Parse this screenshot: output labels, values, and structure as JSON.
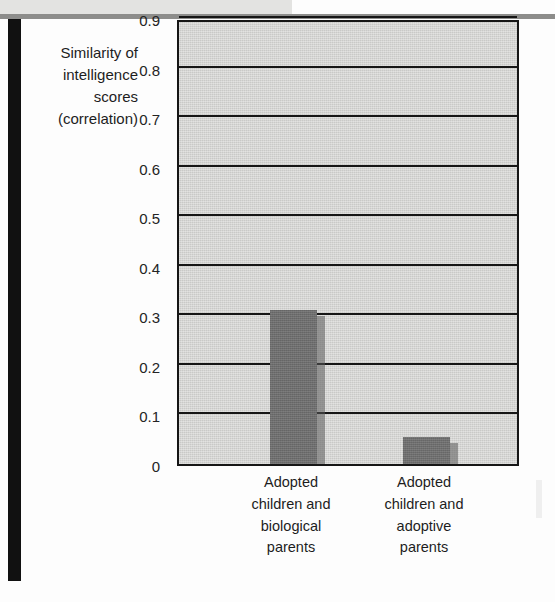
{
  "chart_data": {
    "type": "bar",
    "title": "",
    "subtitle": "",
    "xlabel": "",
    "ylabel": "Similarity of intelligence scores (correlation)",
    "ylabel_lines": [
      "Similarity of",
      "intelligence",
      "scores",
      "(correlation)"
    ],
    "categories": [
      "Adopted children and biological parents",
      "Adopted children and adoptive parents"
    ],
    "category_lines": [
      [
        "Adopted",
        "children and",
        "biological",
        "parents"
      ],
      [
        "Adopted",
        "children and",
        "adoptive",
        "parents"
      ]
    ],
    "values": [
      0.31,
      0.055
    ],
    "ylim": [
      0,
      0.9
    ],
    "ytick_values": [
      0.9,
      0.8,
      0.7,
      0.6,
      0.5,
      0.4,
      0.3,
      0.2,
      0.1,
      0
    ],
    "ytick_labels": [
      "0.9",
      "0.8",
      "0.7",
      "0.6",
      "0.5",
      "0.4",
      "0.3",
      "0.2",
      "0.1",
      "0"
    ],
    "grid": true,
    "grid_orientation": "horizontal",
    "legend": false,
    "legend_position": "none",
    "bar_color": "#6e6e6e",
    "plot_background": "#c9c9c7",
    "axis_color": "#161616",
    "text_color": "#1d1d1d"
  }
}
